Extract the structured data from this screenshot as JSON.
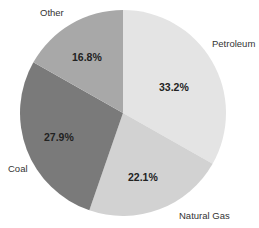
{
  "chart_data": {
    "type": "pie",
    "title": "",
    "categories": [
      "Petroleum",
      "Natural Gas",
      "Coal",
      "Other"
    ],
    "values": [
      33.2,
      22.1,
      27.9,
      16.8
    ],
    "value_labels": [
      "33.2%",
      "22.1%",
      "27.9%",
      "16.8%"
    ],
    "colors": [
      "#e4e4e4",
      "#d2d2d2",
      "#7a7a7a",
      "#a8a8a8"
    ],
    "start_angle": "12 o'clock",
    "direction": "clockwise",
    "legend": "none (labels placed outside slices)"
  },
  "labels": {
    "petroleum": "Petroleum",
    "natural_gas": "Natural Gas",
    "coal": "Coal",
    "other": "Other",
    "petroleum_pct": "33.2%",
    "natural_gas_pct": "22.1%",
    "coal_pct": "27.9%",
    "other_pct": "16.8%"
  }
}
